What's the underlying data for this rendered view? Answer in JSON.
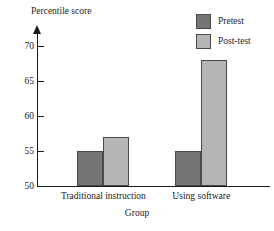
{
  "chart_data": {
    "type": "bar",
    "title": "",
    "xlabel": "Group",
    "ylabel": "Percentile score",
    "categories": [
      "Traditional instruction",
      "Using software"
    ],
    "series": [
      {
        "name": "Pretest",
        "color": "#757575",
        "values": [
          55,
          55
        ]
      },
      {
        "name": "Post-test",
        "color": "#b5b5b5",
        "values": [
          57,
          68
        ]
      }
    ],
    "ylim": [
      50,
      72
    ],
    "yticks": [
      50,
      55,
      60,
      65,
      70
    ],
    "ytick_labels": [
      "50",
      "55",
      "60",
      "65",
      "70"
    ],
    "grid": false,
    "legend_position": "top-right",
    "axis_color": "#1a1a1a",
    "bar_border_color": "#4a4a4a",
    "background": "#ffffff"
  },
  "legend": {
    "items": [
      {
        "label": "Pretest"
      },
      {
        "label": "Post-test"
      }
    ]
  }
}
